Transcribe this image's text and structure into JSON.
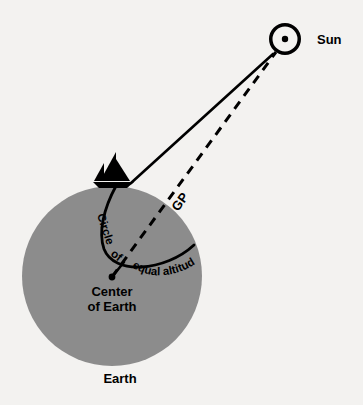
{
  "figure": {
    "background_color": "#f3f2f0",
    "ink_color": "#000000",
    "earth_fill_color": "#8c8c8c"
  },
  "labels": {
    "sun": "Sun",
    "gp": "GP",
    "earth": "Earth",
    "center_line1": "Center",
    "center_line2": "of Earth",
    "circle_word_1": "Circle",
    "circle_word_2": "of",
    "circle_word_3": "equal altitude",
    "circle_full": "Circle of equal altitude"
  },
  "objects": {
    "sun": {
      "name": "sun-symbol",
      "center_x": 285,
      "center_y": 39,
      "outer_radius": 16,
      "ring_width": 3.5,
      "dot_radius": 3.2
    },
    "earth": {
      "name": "earth-disc",
      "center_x": 112,
      "center_y": 276,
      "radius": 90,
      "fill": "#8c8c8c"
    },
    "earth_center_dot": {
      "name": "earth-center-dot",
      "x": 112,
      "y": 277,
      "radius": 3.4
    },
    "boat": {
      "name": "sailboat",
      "hull_left_x": 96,
      "hull_right_x": 132,
      "hull_y": 184,
      "mast_x": 116,
      "mast_top_y": 153
    },
    "gp_point": {
      "name": "geographic-position-point",
      "x": 139,
      "y": 248
    }
  },
  "lines": {
    "sight_line": {
      "name": "sight-line-boat-to-sun",
      "style": "solid",
      "from_x": 133,
      "from_y": 182,
      "to_x": 273,
      "to_y": 54,
      "stroke_width": 2.6
    },
    "gp_line": {
      "name": "gp-line-center-to-sun",
      "style": "dashed",
      "from_x": 112,
      "from_y": 277,
      "to_x": 276,
      "to_y": 52,
      "stroke_width": 3.0,
      "dash_pattern": "9 7"
    },
    "circle_of_equal_altitude": {
      "name": "circle-of-equal-altitude-arc",
      "style": "solid",
      "stroke_width": 2.8
    }
  }
}
